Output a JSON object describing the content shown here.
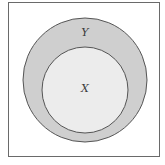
{
  "diagram": {
    "type": "venn-subset",
    "sets": [
      {
        "label": "Y",
        "role": "outer",
        "fill": "#cfcfcf",
        "stroke": "#555555"
      },
      {
        "label": "X",
        "role": "inner",
        "fill": "#ececec",
        "stroke": "#555555"
      }
    ]
  },
  "labels": {
    "outer": "Y",
    "inner": "X"
  }
}
